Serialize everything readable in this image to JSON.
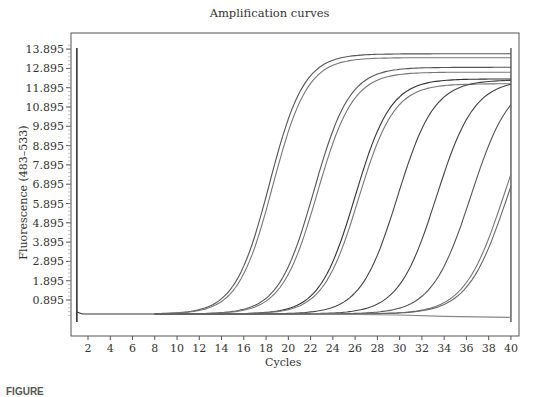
{
  "chart_data": {
    "type": "line",
    "title": "Amplification curves",
    "xlabel": "Cycles",
    "ylabel": "Fluorescence (483–533)",
    "xlim": [
      1,
      40
    ],
    "ylim": [
      0,
      14.2
    ],
    "grid": false,
    "legend": null,
    "x_ticks": [
      2,
      4,
      6,
      8,
      10,
      12,
      14,
      16,
      18,
      20,
      22,
      24,
      26,
      28,
      30,
      32,
      34,
      36,
      38,
      40
    ],
    "y_ticks": [
      0.895,
      1.895,
      2.895,
      3.895,
      4.895,
      5.895,
      6.895,
      7.895,
      8.895,
      9.895,
      10.895,
      11.895,
      12.895,
      13.895
    ],
    "y_tick_labels": [
      "0.895",
      "1.895",
      "2.895",
      "3.895",
      "4.895",
      "5.895",
      "6.895",
      "7.895",
      "8.895",
      "9.895",
      "10.895",
      "11.895",
      "12.895",
      "13.895"
    ],
    "baseline": 0.17,
    "series": [
      {
        "name": "Sample 1",
        "half_max_cycle": 18.3,
        "plateau": 13.65,
        "slope": 1.55,
        "start_cycle": 8,
        "color": "#555555"
      },
      {
        "name": "Sample 2",
        "half_max_cycle": 18.6,
        "plateau": 13.45,
        "slope": 1.55,
        "start_cycle": 8,
        "color": "#777777"
      },
      {
        "name": "Sample 3",
        "half_max_cycle": 22.3,
        "plateau": 12.95,
        "slope": 1.6,
        "start_cycle": 8,
        "color": "#555555"
      },
      {
        "name": "Sample 4",
        "half_max_cycle": 22.6,
        "plateau": 12.7,
        "slope": 1.6,
        "start_cycle": 8,
        "color": "#777777"
      },
      {
        "name": "Sample 5",
        "half_max_cycle": 26.0,
        "plateau": 12.35,
        "slope": 1.6,
        "start_cycle": 8,
        "color": "#333333"
      },
      {
        "name": "Sample 6",
        "half_max_cycle": 26.3,
        "plateau": 12.1,
        "slope": 1.6,
        "start_cycle": 8,
        "color": "#777777"
      },
      {
        "name": "Sample 7",
        "half_max_cycle": 29.8,
        "plateau": 12.3,
        "slope": 1.65,
        "start_cycle": 8,
        "color": "#444444"
      },
      {
        "name": "Sample 8",
        "half_max_cycle": 33.3,
        "plateau": 12.3,
        "slope": 1.7,
        "start_cycle": 8,
        "color": "#444444"
      },
      {
        "name": "Sample 9",
        "half_max_cycle": 36.4,
        "plateau": 12.4,
        "slope": 1.75,
        "start_cycle": 8,
        "color": "#555555"
      },
      {
        "name": "Sample 10",
        "half_max_cycle": 39.4,
        "plateau": 12.6,
        "slope": 1.8,
        "start_cycle": 8,
        "color": "#777777"
      },
      {
        "name": "Sample 11",
        "half_max_cycle": 39.7,
        "plateau": 12.4,
        "slope": 1.8,
        "start_cycle": 8,
        "color": "#666666"
      },
      {
        "name": "Negative control",
        "flat": true,
        "values_by_cycle": {
          "22": 0.17,
          "30": 0.12,
          "34": 0.05,
          "40": 0.0
        },
        "color": "#888888"
      }
    ],
    "annotations": [
      "vertical marker at cycle 1",
      "vertical marker at cycle 40"
    ]
  },
  "caption_partial": "FIGURE"
}
